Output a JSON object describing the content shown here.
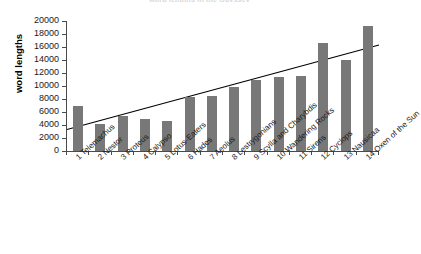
{
  "chart_data": {
    "type": "bar",
    "title": "word lengths in the Odyssey",
    "subtitle": "",
    "xlabel": "",
    "ylabel": "word lengths",
    "ylim": [
      0,
      20000
    ],
    "ytick_step": 2000,
    "yticks": [
      0,
      2000,
      4000,
      6000,
      8000,
      10000,
      12000,
      14000,
      16000,
      18000,
      20000
    ],
    "ytick_labels": [
      "0",
      "2000",
      "4000",
      "6000",
      "8000",
      "10000",
      "12000",
      "14000",
      "16000",
      "18000",
      "20000"
    ],
    "grid": false,
    "legend": false,
    "legend_position": "none",
    "bar_color": "#787878",
    "axis_color": "#4a4a4a",
    "trendline_color": "#000000",
    "categories": [
      "1 Telemachus",
      "2 Nestor",
      "3 Proteus",
      "4 Calypso",
      "5 Lotus-Eaters",
      "6 Hades",
      "7 Aeolus",
      "8 Lestrygonians",
      "9 Scylla and Charybdis",
      "10 Wandering Rocks",
      "11 Sirens",
      "12 Cyclops",
      "13 Nausicaa",
      "14 Oxen of the Sun"
    ],
    "values": [
      7000,
      4200,
      5400,
      4900,
      4550,
      8300,
      8450,
      9800,
      10900,
      11400,
      11500,
      16600,
      14050,
      19200
    ],
    "series": [
      {
        "name": "word lengths",
        "values": [
          7000,
          4200,
          5400,
          4900,
          4550,
          8300,
          8450,
          9800,
          10900,
          11400,
          11500,
          16600,
          14050,
          19200
        ]
      }
    ],
    "trendline": {
      "type": "linear",
      "y_start": 3300,
      "y_end": 16300,
      "visible": true
    }
  }
}
